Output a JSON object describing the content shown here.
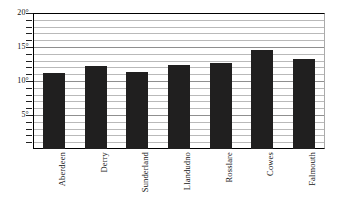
{
  "chart_data": {
    "type": "bar",
    "title": "",
    "subtitle": "",
    "xlabel": "",
    "ylabel": "",
    "categories": [
      "Aberdeen",
      "Derry",
      "Sunderland",
      "Llandudno",
      "Rosslare",
      "Cowes",
      "Falmouth"
    ],
    "values": [
      11.2,
      12.2,
      11.3,
      12.4,
      12.7,
      14.5,
      13.2
    ],
    "ylim": [
      0,
      20
    ],
    "y_major_ticks": [
      5,
      10,
      15,
      20
    ],
    "y_tick_labels": [
      "5°",
      "10°",
      "15°",
      "20°"
    ],
    "y_minor_tick_step": 1,
    "grid": true,
    "gridline_values": [
      1,
      2,
      3,
      4,
      5,
      6,
      7,
      8,
      9,
      10,
      11,
      12,
      13,
      14,
      15,
      16,
      17,
      18,
      19,
      20
    ],
    "legend": null,
    "legend_position": "none",
    "bar_color": "#201f1f",
    "gridline_color": "#b9b9b9",
    "axis_color": "#000000",
    "background_color": "#ffffff",
    "unit_symbol": "°"
  },
  "axis": {
    "y_labels": [
      {
        "text": "20°",
        "value": 20
      },
      {
        "text": "15°",
        "value": 15
      },
      {
        "text": "10°",
        "value": 10
      },
      {
        "text": "5°",
        "value": 5
      }
    ]
  },
  "bars": [
    {
      "label": "Aberdeen",
      "value": 11.2
    },
    {
      "label": "Derry",
      "value": 12.2
    },
    {
      "label": "Sunderland",
      "value": 11.3
    },
    {
      "label": "Llandudno",
      "value": 12.4
    },
    {
      "label": "Rosslare",
      "value": 12.7
    },
    {
      "label": "Cowes",
      "value": 14.5
    },
    {
      "label": "Falmouth",
      "value": 13.2
    }
  ]
}
